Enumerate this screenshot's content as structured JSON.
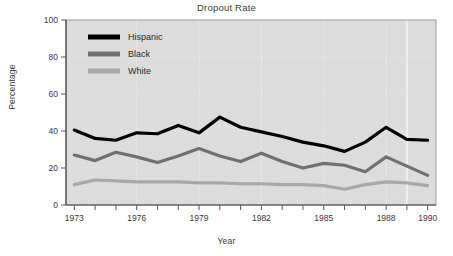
{
  "chart_data": {
    "type": "line",
    "title": "Dropout Rate",
    "xlabel": "Year",
    "ylabel": "Percentage",
    "x": [
      1973,
      1974,
      1975,
      1976,
      1977,
      1978,
      1979,
      1980,
      1981,
      1982,
      1983,
      1984,
      1985,
      1986,
      1987,
      1988,
      1989,
      1990
    ],
    "xlim": [
      1972.6,
      1990.4
    ],
    "ylim": [
      0,
      100
    ],
    "xticks": [
      1973,
      1974,
      1975,
      1976,
      1977,
      1978,
      1979,
      1980,
      1981,
      1982,
      1983,
      1984,
      1985,
      1986,
      1987,
      1988,
      1989,
      1990
    ],
    "xtick_labels": [
      "1973",
      "",
      "",
      "1976",
      "",
      "",
      "1979",
      "",
      "",
      "1982",
      "",
      "",
      "1985",
      "",
      "",
      "1988",
      "",
      "1990"
    ],
    "yticks": [
      0,
      20,
      40,
      60,
      80,
      100
    ],
    "ytick_labels": [
      "0",
      "20",
      "40",
      "60",
      "80",
      "100"
    ],
    "grid": true,
    "grid_style": "dotted-horizontal",
    "legend_position": "upper-left",
    "plot_background": "#dcdcdc",
    "series": [
      {
        "name": "Hispanic",
        "color": "#000000",
        "values": [
          40.5,
          36.0,
          35.0,
          39.0,
          38.5,
          43.0,
          39.0,
          47.5,
          42.0,
          39.5,
          37.0,
          34.0,
          32.0,
          29.0,
          34.0,
          42.0,
          35.5,
          35.0
        ]
      },
      {
        "name": "Black",
        "color": "#707070",
        "values": [
          27.0,
          24.0,
          28.5,
          26.0,
          23.0,
          26.5,
          30.5,
          26.5,
          23.5,
          28.0,
          23.5,
          20.0,
          22.5,
          21.5,
          18.0,
          26.0,
          21.0,
          16.0
        ]
      },
      {
        "name": "White",
        "color": "#a8a8a8",
        "values": [
          11.0,
          13.5,
          13.0,
          12.5,
          12.5,
          12.5,
          12.0,
          12.0,
          11.5,
          11.5,
          11.0,
          11.0,
          10.5,
          8.5,
          11.0,
          12.5,
          12.0,
          10.5
        ]
      }
    ]
  }
}
